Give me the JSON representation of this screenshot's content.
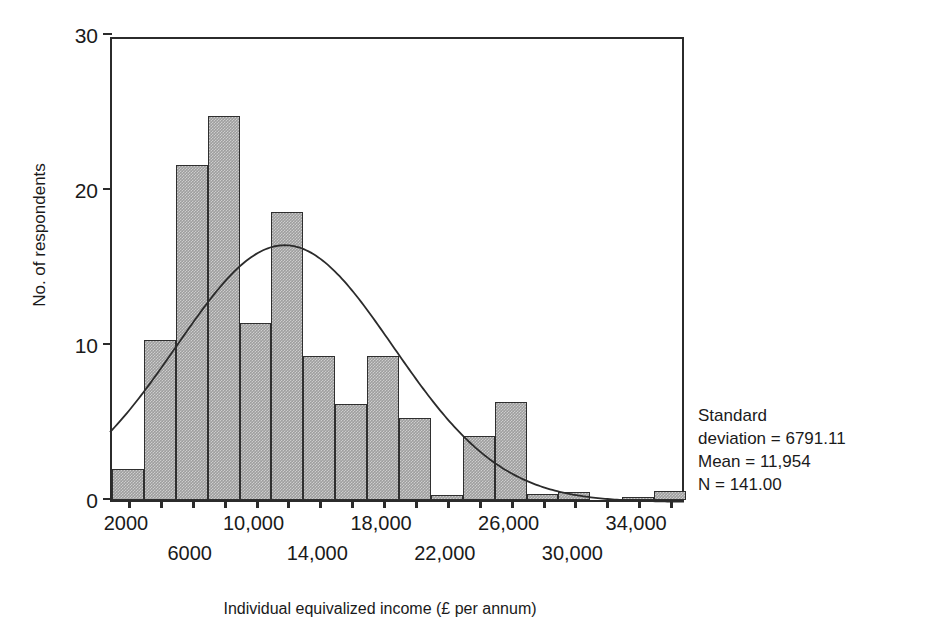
{
  "chart_data": {
    "type": "bar",
    "title": "",
    "xlabel": "Individual equivalized income (£ per annum)",
    "ylabel": "No. of respondents",
    "ylim": [
      0,
      30
    ],
    "yticks": [
      0,
      10,
      20,
      30
    ],
    "ytick_labels": [
      "0",
      "10",
      "20",
      "30"
    ],
    "grid": false,
    "legend": "none",
    "bin_width": 2000,
    "categories": [
      "2000",
      "4000",
      "6000",
      "8000",
      "10,000",
      "12,000",
      "14,000",
      "16,000",
      "18,000",
      "20,000",
      "22,000",
      "24,000",
      "26,000",
      "28,000",
      "30,000",
      "32,000",
      "34,000",
      "36,000"
    ],
    "values": [
      2,
      10.3,
      21.6,
      24.8,
      11.4,
      18.6,
      9.3,
      6.2,
      9.3,
      5.3,
      0.3,
      4.1,
      6.3,
      0.4,
      0.5,
      0,
      0.1,
      0.6
    ],
    "xtick_labels": [
      {
        "category": "2000",
        "text": "2000",
        "row": 0
      },
      {
        "category": "6000",
        "text": "6000",
        "row": 1
      },
      {
        "category": "10,000",
        "text": "10,000",
        "row": 0
      },
      {
        "category": "14,000",
        "text": "14,000",
        "row": 1
      },
      {
        "category": "18,000",
        "text": "18,000",
        "row": 0
      },
      {
        "category": "22,000",
        "text": "22,000",
        "row": 1
      },
      {
        "category": "26,000",
        "text": "26,000",
        "row": 0
      },
      {
        "category": "30,000",
        "text": "30,000",
        "row": 1
      },
      {
        "category": "34,000",
        "text": "34,000",
        "row": 0
      }
    ],
    "overlay": {
      "type": "normal-curve",
      "mean": 11954,
      "std": 6791.11,
      "n": 141
    },
    "annotations": [
      "Standard",
      "deviation = 6791.11",
      "Mean = 11,954",
      "N = 141.00"
    ],
    "colors": {
      "bar_fill": "#9e9e9e",
      "bar_border": "#2f2f2f",
      "axis": "#2b2b2b",
      "text": "#1a1a1a",
      "curve": "#2b2b2b",
      "background": "#ffffff"
    }
  },
  "stats": {
    "line1": "Standard",
    "line2": "deviation = 6791.11",
    "line3": "Mean = 11,954",
    "line4": "N = 141.00"
  },
  "axes": {
    "x_title": "Individual equivalized income (£ per annum)",
    "y_title": "No. of respondents"
  }
}
